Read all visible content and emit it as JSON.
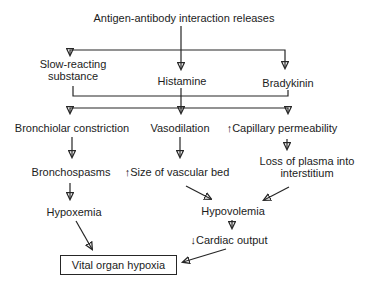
{
  "diagram": {
    "title": "Antigen-antibody interaction releases",
    "nodes": {
      "slow_reacting_substance": "Slow-reacting substance",
      "histamine": "Histamine",
      "bradykinin": "Bradykinin",
      "bronchiolar_constriction": "Bronchiolar constriction",
      "vasodilation": "Vasodilation",
      "capillary_permeability": "↑Capillary permeability",
      "bronchospasms": "Bronchospasms",
      "size_of_vascular_bed": "↑Size of vascular bed",
      "loss_of_plasma": "Loss of plasma into interstitium",
      "hypoxemia": "Hypoxemia",
      "hypovolemia": "Hypovolemia",
      "cardiac_output": "↓Cardiac output",
      "vital_organ_hypoxia": "Vital organ hypoxia"
    },
    "colors": {
      "text": "#1c1c1c",
      "line": "#262626",
      "background": "#ffffff"
    }
  }
}
